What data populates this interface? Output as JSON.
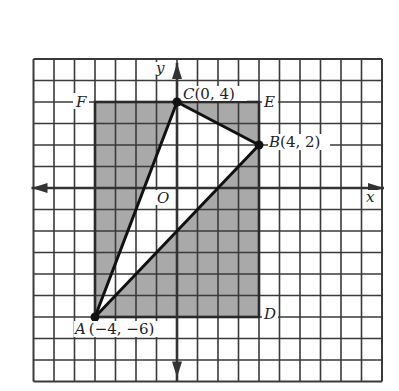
{
  "diagram": {
    "type": "coordinate-plane-geometry",
    "grid": {
      "columns": 17,
      "rows": 15,
      "origin_col": 7,
      "origin_row": 6
    },
    "axes": {
      "x_label": "x",
      "y_label": "y",
      "origin_label": "O"
    },
    "colors": {
      "shade": "#a9a9a9",
      "grid_line": "#3a3a3a",
      "segment": "#111111",
      "background": "#ffffff"
    },
    "rectangle": {
      "vertices": [
        "A",
        "D",
        "E",
        "F"
      ],
      "shaded": true
    },
    "triangle": {
      "vertices": [
        "A",
        "B",
        "C"
      ],
      "fill": "white"
    },
    "points": [
      {
        "name": "A",
        "x": -4,
        "y": -6,
        "label": "A",
        "coords_label": "(−4, −6)",
        "dot": true
      },
      {
        "name": "B",
        "x": 4,
        "y": 2,
        "label": "B",
        "coords_label": "(4, 2)",
        "dot": true
      },
      {
        "name": "C",
        "x": 0,
        "y": 4,
        "label": "C",
        "coords_label": "(0, 4)",
        "dot": true
      },
      {
        "name": "D",
        "x": 4,
        "y": -6,
        "label": "D",
        "coords_label": "",
        "dot": false
      },
      {
        "name": "E",
        "x": 4,
        "y": 4,
        "label": "E",
        "coords_label": "",
        "dot": false
      },
      {
        "name": "F",
        "x": -4,
        "y": 4,
        "label": "F",
        "coords_label": "",
        "dot": false
      }
    ],
    "labels": {
      "A": "A",
      "A_coords": "(−4, −6)",
      "B": "B",
      "B_coords": "(4, 2)",
      "C": "C",
      "C_coords": "(0, 4)",
      "D": "D",
      "E": "E",
      "F": "F",
      "O": "O",
      "x": "x",
      "y": "y"
    }
  }
}
